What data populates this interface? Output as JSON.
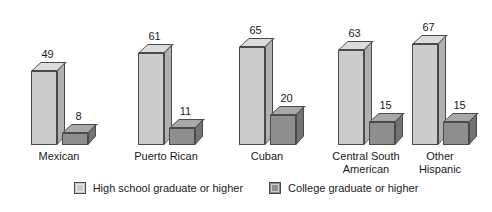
{
  "chart_data": {
    "type": "bar",
    "title": "",
    "subtitle": "",
    "xlabel": "",
    "ylabel": "",
    "ylim": [
      0,
      75
    ],
    "grid": false,
    "legend_position": "bottom",
    "style": "3d-grouped-column",
    "categories": [
      "Mexican",
      "Puerto Rican",
      "Cuban",
      "Central South American",
      "Other Hispanic"
    ],
    "category_lines": [
      [
        "Mexican"
      ],
      [
        "Puerto Rican"
      ],
      [
        "Cuban"
      ],
      [
        "Central South",
        "American"
      ],
      [
        "Other",
        "Hispanic"
      ]
    ],
    "series": [
      {
        "name": "High school graduate or higher",
        "color": "#cccccc",
        "values": [
          49,
          61,
          65,
          63,
          67
        ]
      },
      {
        "name": "College graduate or higher",
        "color": "#8e8e8e",
        "values": [
          8,
          11,
          20,
          15,
          15
        ]
      }
    ],
    "data_labels": [
      [
        "49",
        "8"
      ],
      [
        "61",
        "11"
      ],
      [
        "65",
        "20"
      ],
      [
        "63",
        "15"
      ],
      [
        "67",
        "15"
      ]
    ]
  },
  "legend": {
    "items": [
      {
        "label": "High school graduate or higher",
        "swatch": "light-gray-swatch-icon"
      },
      {
        "label": "College graduate or higher",
        "swatch": "dark-gray-swatch-icon"
      }
    ]
  }
}
